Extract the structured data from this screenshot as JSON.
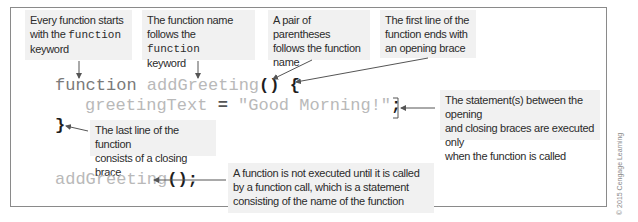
{
  "diagram": {
    "callouts": {
      "function_keyword": {
        "line1": "Every function starts",
        "line2_prefix": "with the ",
        "line2_code": "function",
        "line3": "keyword"
      },
      "function_name": {
        "line1": "The function name",
        "line2_prefix": "follows the ",
        "line2_code": "function",
        "line3": "keyword"
      },
      "parentheses": {
        "line1": "A pair of parentheses",
        "line2": "follows the function",
        "line3": "name"
      },
      "opening_brace": {
        "line1": "The first line of the",
        "line2": "function ends with",
        "line3": "an opening brace"
      },
      "statements": {
        "line1": "The statement(s) between the opening",
        "line2": "and closing braces are executed only",
        "line3": "when the function is called"
      },
      "closing_brace": {
        "line1": "The last line of the function",
        "line2": "consists of a closing brace"
      },
      "function_call": {
        "line1": "A function is not executed until it is called",
        "line2": "by a function call, which is a statement",
        "line3": "consisting of the name of the function"
      }
    },
    "code": {
      "line1": {
        "keyword": "function",
        "name": "addGreeting",
        "parens": "()",
        "brace": "{"
      },
      "line2": {
        "variable": "greetingText",
        "equals": "=",
        "string": "\"Good Morning!\"",
        "semicolon": ";"
      },
      "line3": {
        "brace": "}"
      },
      "line4": {
        "name": "addGreeting",
        "parens": "()",
        "semicolon": ";"
      }
    },
    "copyright": "© 2015 Cengage Learning",
    "colors": {
      "callout_bg": "#f1f1f1",
      "frame_border": "#8a8a8a",
      "code_light": "#b9b9b9",
      "code_keyword": "#7a7a7a",
      "arrow": "#555555"
    }
  }
}
